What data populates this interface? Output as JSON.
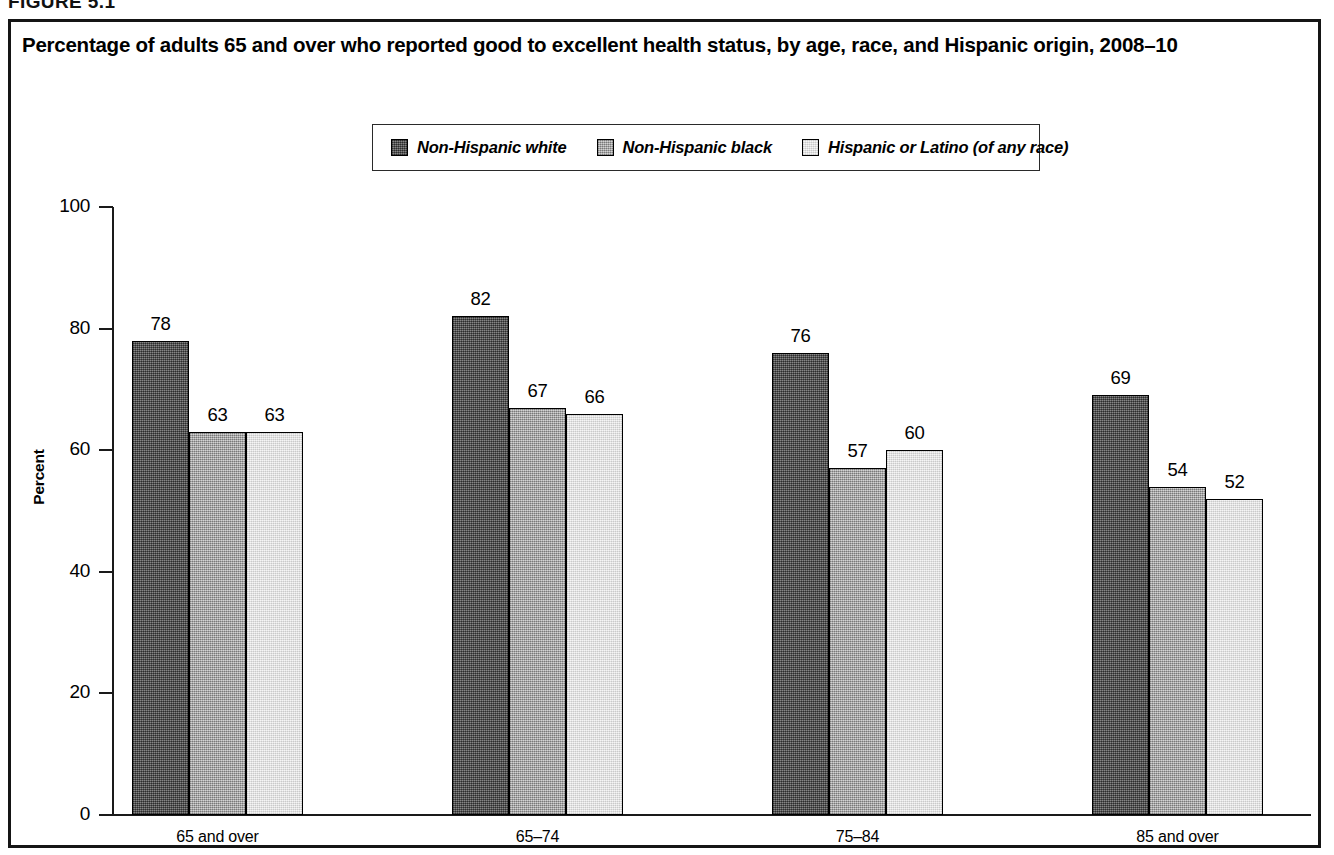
{
  "figure": {
    "number_label": "FIGURE 5.1"
  },
  "chart_title": "Percentage of adults 65 and over who reported good to excellent health status, by age, race, and Hispanic origin, 2008–10",
  "legend": {
    "items": [
      {
        "label": "Non-Hispanic white",
        "swatch": "fill-dark"
      },
      {
        "label": "Non-Hispanic black",
        "swatch": "fill-medium"
      },
      {
        "label": "Hispanic or Latino (of any race)",
        "swatch": "fill-light"
      }
    ]
  },
  "axes": {
    "y_title": "Percent",
    "y_ticks": [
      "0",
      "20",
      "40",
      "60",
      "80",
      "100"
    ],
    "y_min": 0,
    "y_max": 100
  },
  "chart_data": {
    "type": "bar",
    "title": "Percentage of adults 65 and over who reported good to excellent health status, by age, race, and Hispanic origin, 2008–10",
    "xlabel": "",
    "ylabel": "Percent",
    "ylim": [
      0,
      100
    ],
    "yticks": [
      0,
      20,
      40,
      60,
      80,
      100
    ],
    "grid": false,
    "legend_position": "top-center",
    "categories": [
      "65 and over",
      "65–74",
      "75–84",
      "85 and over"
    ],
    "series": [
      {
        "name": "Non-Hispanic white",
        "values": [
          78,
          82,
          76,
          69
        ],
        "fill": "#5b5b5b"
      },
      {
        "name": "Non-Hispanic black",
        "values": [
          63,
          67,
          57,
          54
        ],
        "fill": "#ababab"
      },
      {
        "name": "Hispanic or Latino (of any race)",
        "values": [
          63,
          66,
          60,
          52
        ],
        "fill": "#e9e9e9"
      }
    ],
    "data_labels": [
      [
        "78",
        "63",
        "63"
      ],
      [
        "82",
        "67",
        "66"
      ],
      [
        "76",
        "57",
        "60"
      ],
      [
        "69",
        "54",
        "52"
      ]
    ]
  },
  "colors": {
    "frame": "#151515",
    "axis": "#1a1a1a",
    "bar_dark": "#5b5b5b",
    "bar_medium": "#ababab",
    "bar_light": "#e9e9e9",
    "background": "#ffffff"
  }
}
